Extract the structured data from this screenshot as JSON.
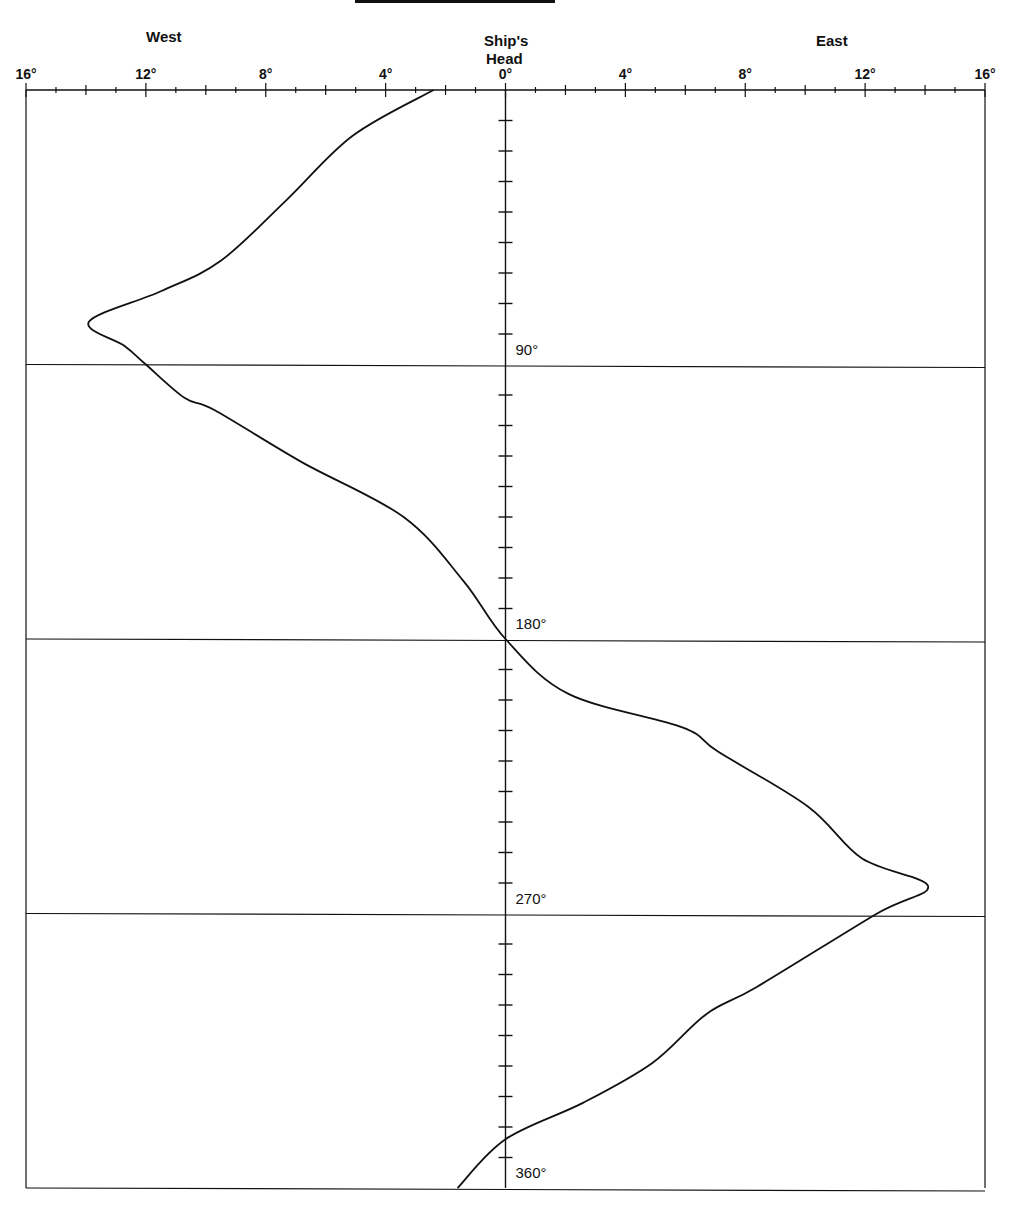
{
  "header": {
    "west_label": "West",
    "east_label": "East",
    "center_label_line1": "Ship's",
    "center_label_line2": "Head"
  },
  "x_tick_labels": [
    {
      "text": "16°",
      "value": -16
    },
    {
      "text": "12°",
      "value": -12
    },
    {
      "text": "8°",
      "value": -8
    },
    {
      "text": "4°",
      "value": -4
    },
    {
      "text": "0°",
      "value": 0
    },
    {
      "text": "4°",
      "value": 4
    },
    {
      "text": "8°",
      "value": 8
    },
    {
      "text": "12°",
      "value": 12
    },
    {
      "text": "16°",
      "value": 16
    }
  ],
  "heading_labels": [
    {
      "text": "90°",
      "value": 90
    },
    {
      "text": "180°",
      "value": 180
    },
    {
      "text": "270°",
      "value": 270
    },
    {
      "text": "360°",
      "value": 360
    }
  ],
  "colors": {
    "line": "#111111",
    "background": "#ffffff"
  },
  "chart_data": {
    "type": "line",
    "title": "",
    "xlabel": "Deviation (West ← Ship's Head → East)",
    "ylabel": "Ship's Head (degrees)",
    "xlim": [
      -16,
      16
    ],
    "ylim": [
      0,
      360
    ],
    "x_ticks": [
      -16,
      -12,
      -8,
      -4,
      0,
      4,
      8,
      12,
      16
    ],
    "x_minor_tick_step": 1,
    "y_gridlines": [
      90,
      180,
      270,
      360
    ],
    "y_minor_tick_step": 10,
    "grid": "horizontal lines at 90° intervals",
    "legend": null,
    "series": [
      {
        "name": "Deviation curve",
        "points": [
          {
            "heading": 0,
            "deviation": -2.4
          },
          {
            "heading": 15,
            "deviation": -5.1
          },
          {
            "heading": 36,
            "deviation": -7.3
          },
          {
            "heading": 56,
            "deviation": -9.5
          },
          {
            "heading": 66,
            "deviation": -11.5
          },
          {
            "heading": 76,
            "deviation": -13.9
          },
          {
            "heading": 84,
            "deviation": -12.7
          },
          {
            "heading": 90,
            "deviation": -12.0
          },
          {
            "heading": 101,
            "deviation": -10.7
          },
          {
            "heading": 105,
            "deviation": -9.7
          },
          {
            "heading": 122,
            "deviation": -6.8
          },
          {
            "heading": 140,
            "deviation": -3.4
          },
          {
            "heading": 161,
            "deviation": -1.4
          },
          {
            "heading": 180,
            "deviation": 0.0
          },
          {
            "heading": 198,
            "deviation": 2.1
          },
          {
            "heading": 209,
            "deviation": 5.9
          },
          {
            "heading": 217,
            "deviation": 7.1
          },
          {
            "heading": 235,
            "deviation": 10.1
          },
          {
            "heading": 252,
            "deviation": 11.9
          },
          {
            "heading": 261,
            "deviation": 14.1
          },
          {
            "heading": 270,
            "deviation": 12.4
          },
          {
            "heading": 294,
            "deviation": 8.4
          },
          {
            "heading": 303,
            "deviation": 6.7
          },
          {
            "heading": 319,
            "deviation": 4.9
          },
          {
            "heading": 332,
            "deviation": 2.6
          },
          {
            "heading": 344,
            "deviation": 0.0
          },
          {
            "heading": 360,
            "deviation": -1.6
          }
        ]
      }
    ]
  }
}
